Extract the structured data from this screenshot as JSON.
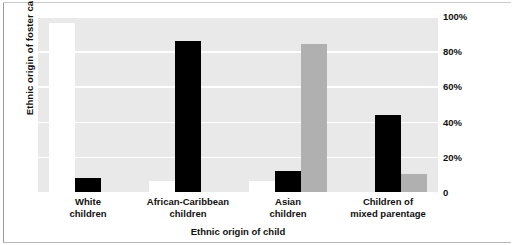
{
  "chart_data": {
    "type": "bar",
    "title": "",
    "xlabel": "Ethnic origin of child",
    "ylabel": "Ethnic origin of foster carer",
    "categories": [
      "White children",
      "African-Caribbean children",
      "Asian children",
      "Children of mixed parentage"
    ],
    "category_lines": [
      [
        "White",
        "children"
      ],
      [
        "African-Caribbean",
        "children"
      ],
      [
        "Asian",
        "children"
      ],
      [
        "Children of",
        "mixed parentage"
      ]
    ],
    "series": [
      {
        "name": "White foster carer",
        "color": "#ffffff",
        "values": [
          96,
          6,
          6,
          0
        ]
      },
      {
        "name": "African-Caribbean foster carer",
        "color": "#000000",
        "values": [
          8,
          86,
          12,
          44
        ]
      },
      {
        "name": "Asian foster carer",
        "color": "#b0b0b0",
        "values": [
          0,
          0,
          84,
          10
        ]
      }
    ],
    "ylim": [
      0,
      100
    ],
    "yticks": [
      0,
      20,
      40,
      60,
      80,
      100
    ],
    "ytick_labels": [
      "0",
      "20%",
      "40%",
      "60%",
      "80%",
      "100%"
    ],
    "y_axis_position": "right",
    "grid": true,
    "grid_color": "#ffffff",
    "plot_background": "#e9e9e9",
    "legend": "none"
  }
}
